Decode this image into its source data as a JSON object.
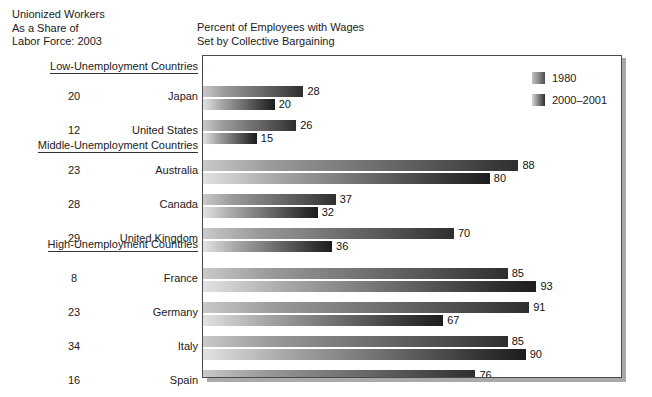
{
  "headings": {
    "left": "Unionized Workers\nAs a Share of\nLabor Force: 2003",
    "right": "Percent of Employees with Wages\nSet by Collective Bargaining"
  },
  "legend": {
    "series": [
      {
        "label": "1980",
        "swatch": "legend-swatch-1980"
      },
      {
        "label": "2000–2001",
        "swatch": "legend-swatch-2000-2001"
      }
    ]
  },
  "sections": [
    {
      "label": "Low-Unemployment Countries"
    },
    {
      "label": "Middle-Unemployment Countries"
    },
    {
      "label": "High-Unemployment Countries"
    }
  ],
  "rows": [
    {
      "country": "Japan",
      "union_share": "20",
      "v1980": "28",
      "v2000": "20"
    },
    {
      "country": "United States",
      "union_share": "12",
      "v1980": "26",
      "v2000": "15"
    },
    {
      "country": "Australia",
      "union_share": "23",
      "v1980": "88",
      "v2000": "80"
    },
    {
      "country": "Canada",
      "union_share": "28",
      "v1980": "37",
      "v2000": "32"
    },
    {
      "country": "United Kingdom",
      "union_share": "29",
      "v1980": "70",
      "v2000": "36"
    },
    {
      "country": "France",
      "union_share": "8",
      "v1980": "85",
      "v2000": "93"
    },
    {
      "country": "Germany",
      "union_share": "23",
      "v1980": "91",
      "v2000": "67"
    },
    {
      "country": "Italy",
      "union_share": "34",
      "v1980": "85",
      "v2000": "90"
    },
    {
      "country": "Spain",
      "union_share": "16",
      "v1980": "76",
      "v2000": "72"
    }
  ],
  "chart_data": {
    "type": "bar",
    "orientation": "horizontal",
    "title": "Percent of Employees with Wages Set by Collective Bargaining",
    "xlabel": "",
    "ylabel": "",
    "xlim": [
      0,
      100
    ],
    "grid": false,
    "legend_position": "top-right",
    "categories": [
      "Japan",
      "United States",
      "Australia",
      "Canada",
      "United Kingdom",
      "France",
      "Germany",
      "Italy",
      "Spain"
    ],
    "series": [
      {
        "name": "1980",
        "values": [
          28,
          26,
          88,
          37,
          70,
          85,
          91,
          85,
          76
        ]
      },
      {
        "name": "2000–2001",
        "values": [
          20,
          15,
          80,
          32,
          36,
          93,
          67,
          90,
          72
        ]
      }
    ],
    "groups": [
      {
        "label": "Low-Unemployment Countries",
        "categories": [
          "Japan",
          "United States"
        ]
      },
      {
        "label": "Middle-Unemployment Countries",
        "categories": [
          "Australia",
          "Canada",
          "United Kingdom"
        ]
      },
      {
        "label": "High-Unemployment Countries",
        "categories": [
          "France",
          "Germany",
          "Italy",
          "Spain"
        ]
      }
    ],
    "annotation_column": {
      "title": "Unionized Workers As a Share of Labor Force: 2003",
      "values": [
        20,
        12,
        23,
        28,
        29,
        8,
        23,
        34,
        16
      ]
    }
  },
  "colors": {
    "frame": "#4a4a4a",
    "shadow": "#a9a9a9",
    "text": "#1a1a1a",
    "background": "#ffffff"
  }
}
